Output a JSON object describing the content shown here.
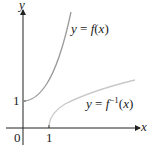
{
  "diagram": {
    "axes": {
      "x_label": "x",
      "y_label": "y",
      "origin_label": "0",
      "x_tick_label": "1",
      "y_tick_label": "1"
    },
    "curves": [
      {
        "name": "f",
        "label_prefix": "y = ",
        "label_func": "f(x)",
        "color": "#9a9a9a"
      },
      {
        "name": "f-inverse",
        "label_prefix": "y = ",
        "label_func": "f",
        "label_sup": "−1",
        "label_arg": "(x)",
        "color": "#c8c8c8"
      }
    ]
  }
}
